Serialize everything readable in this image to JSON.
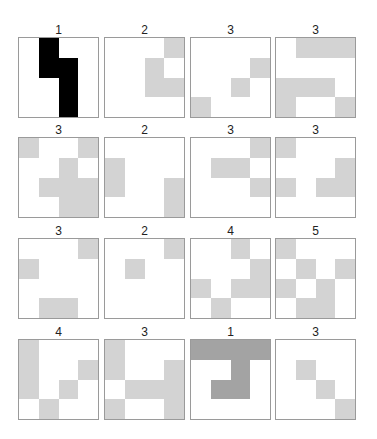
{
  "grid": {
    "rows": 4,
    "cols": 4
  },
  "colors": {
    "light": "#d3d3d3",
    "black": "#000000",
    "dark": "#a3a3a3"
  },
  "panels": [
    {
      "label": "1",
      "color": "black",
      "cells": [
        [
          0,
          1
        ],
        [
          1,
          1
        ],
        [
          1,
          2
        ],
        [
          2,
          2
        ],
        [
          3,
          2
        ]
      ]
    },
    {
      "label": "2",
      "color": "light",
      "cells": [
        [
          0,
          3
        ],
        [
          1,
          2
        ],
        [
          2,
          2
        ],
        [
          2,
          3
        ]
      ]
    },
    {
      "label": "3",
      "color": "light",
      "cells": [
        [
          1,
          3
        ],
        [
          2,
          2
        ],
        [
          3,
          0
        ]
      ]
    },
    {
      "label": "3",
      "color": "light",
      "cells": [
        [
          0,
          1
        ],
        [
          0,
          2
        ],
        [
          0,
          3
        ],
        [
          2,
          0
        ],
        [
          2,
          1
        ],
        [
          2,
          2
        ],
        [
          3,
          0
        ],
        [
          3,
          3
        ]
      ]
    },
    {
      "label": "3",
      "color": "light",
      "cells": [
        [
          0,
          0
        ],
        [
          0,
          3
        ],
        [
          1,
          2
        ],
        [
          2,
          1
        ],
        [
          2,
          2
        ],
        [
          2,
          3
        ],
        [
          3,
          2
        ],
        [
          3,
          3
        ]
      ]
    },
    {
      "label": "2",
      "color": "light",
      "cells": [
        [
          1,
          0
        ],
        [
          2,
          0
        ],
        [
          2,
          3
        ],
        [
          3,
          3
        ]
      ]
    },
    {
      "label": "3",
      "color": "light",
      "cells": [
        [
          0,
          3
        ],
        [
          1,
          1
        ],
        [
          1,
          2
        ],
        [
          2,
          3
        ]
      ]
    },
    {
      "label": "3",
      "color": "light",
      "cells": [
        [
          0,
          0
        ],
        [
          1,
          3
        ],
        [
          2,
          0
        ],
        [
          2,
          2
        ],
        [
          2,
          3
        ]
      ]
    },
    {
      "label": "3",
      "color": "light",
      "cells": [
        [
          0,
          3
        ],
        [
          1,
          0
        ],
        [
          3,
          1
        ],
        [
          3,
          2
        ]
      ]
    },
    {
      "label": "2",
      "color": "light",
      "cells": [
        [
          0,
          3
        ],
        [
          1,
          1
        ]
      ]
    },
    {
      "label": "4",
      "color": "light",
      "cells": [
        [
          0,
          2
        ],
        [
          1,
          3
        ],
        [
          2,
          0
        ],
        [
          2,
          2
        ],
        [
          2,
          3
        ],
        [
          3,
          1
        ]
      ]
    },
    {
      "label": "5",
      "color": "light",
      "cells": [
        [
          0,
          0
        ],
        [
          1,
          1
        ],
        [
          1,
          3
        ],
        [
          2,
          0
        ],
        [
          2,
          2
        ],
        [
          3,
          1
        ],
        [
          3,
          2
        ]
      ]
    },
    {
      "label": "4",
      "color": "light",
      "cells": [
        [
          0,
          0
        ],
        [
          1,
          0
        ],
        [
          2,
          0
        ],
        [
          1,
          3
        ],
        [
          2,
          2
        ],
        [
          3,
          1
        ]
      ]
    },
    {
      "label": "3",
      "color": "light",
      "cells": [
        [
          0,
          0
        ],
        [
          1,
          0
        ],
        [
          1,
          3
        ],
        [
          2,
          1
        ],
        [
          2,
          2
        ],
        [
          2,
          3
        ],
        [
          3,
          0
        ],
        [
          3,
          3
        ]
      ]
    },
    {
      "label": "1",
      "color": "dark",
      "cells": [
        [
          0,
          0
        ],
        [
          0,
          1
        ],
        [
          0,
          2
        ],
        [
          0,
          3
        ],
        [
          1,
          2
        ],
        [
          2,
          1
        ],
        [
          2,
          2
        ]
      ]
    },
    {
      "label": "3",
      "color": "light",
      "cells": [
        [
          1,
          1
        ],
        [
          2,
          2
        ],
        [
          3,
          3
        ]
      ]
    }
  ]
}
